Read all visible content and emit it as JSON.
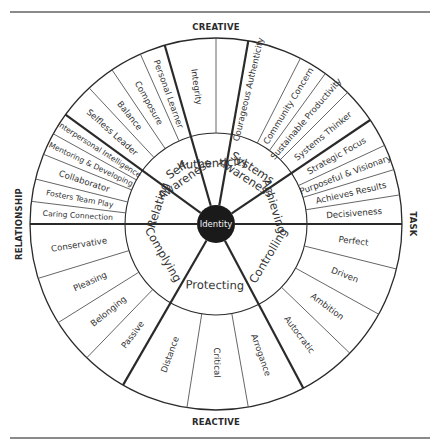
{
  "axes": {
    "top": "CREATIVE",
    "bottom": "REACTIVE",
    "left": "RELATIONSHIP",
    "right": "TASK"
  },
  "center": {
    "label": "Identity",
    "fill": "#1a1a1a"
  },
  "geometry": {
    "cx": 216,
    "cy": 224,
    "r_center": 19,
    "r_inner": 91,
    "r_outer": 186
  },
  "colors": {
    "line": "#2a2a2a",
    "thin_line": "#555555",
    "background": "#ffffff"
  },
  "inner_sectors": [
    {
      "label": "Achieving",
      "start": 0,
      "end": 34
    },
    {
      "label": "Systems Awareness",
      "lines": [
        "Systems",
        "Awareness"
      ],
      "start": 34,
      "end": 80
    },
    {
      "label": "Authenticity",
      "start": 80,
      "end": 106
    },
    {
      "label": "Self-Awareness",
      "lines": [
        "Self-",
        "Awareness"
      ],
      "start": 106,
      "end": 144
    },
    {
      "label": "Relating",
      "start": 144,
      "end": 180
    },
    {
      "label": "Complying",
      "start": 180,
      "end": 240
    },
    {
      "label": "Protecting",
      "start": 240,
      "end": 298
    },
    {
      "label": "Controlling",
      "start": 298,
      "end": 360
    }
  ],
  "outer_segments": [
    {
      "label": "Decisiveness",
      "start": 0,
      "end": 9
    },
    {
      "label": "Achieves Results",
      "start": 9,
      "end": 17
    },
    {
      "label": "Purposeful & Visionary",
      "start": 17,
      "end": 25
    },
    {
      "label": "Strategic Focus",
      "start": 25,
      "end": 34
    },
    {
      "label": "Systems Thinker",
      "start": 34,
      "end": 45
    },
    {
      "label": "Sustainable Productivity",
      "start": 45,
      "end": 54
    },
    {
      "label": "Community Concern",
      "start": 54,
      "end": 63
    },
    {
      "label": "Courageous Authenticity",
      "start": 63,
      "end": 90
    },
    {
      "label": "Integrity",
      "start": 90,
      "end": 106
    },
    {
      "label": "Personal Learner",
      "start": 106,
      "end": 114
    },
    {
      "label": "Composure",
      "start": 114,
      "end": 124
    },
    {
      "label": "Balance",
      "start": 124,
      "end": 133
    },
    {
      "label": "Selfless Leader",
      "start": 133,
      "end": 144
    },
    {
      "label": "Interpersonal Intelligence",
      "start": 144,
      "end": 151
    },
    {
      "label": "Mentoring & Developing",
      "start": 151,
      "end": 158
    },
    {
      "label": "Collaborator",
      "start": 158,
      "end": 166
    },
    {
      "label": "Fosters Team Play",
      "start": 166,
      "end": 173
    },
    {
      "label": "Caring Connection",
      "start": 173,
      "end": 180
    },
    {
      "label": "Conservative",
      "start": 180,
      "end": 197
    },
    {
      "label": "Pleasing",
      "start": 197,
      "end": 212
    },
    {
      "label": "Belonging",
      "start": 212,
      "end": 226
    },
    {
      "label": "Passive",
      "start": 226,
      "end": 240
    },
    {
      "label": "Distance",
      "start": 240,
      "end": 261
    },
    {
      "label": "Critical",
      "start": 261,
      "end": 280
    },
    {
      "label": "Arrogance",
      "start": 280,
      "end": 298
    },
    {
      "label": "Autocratic",
      "start": 298,
      "end": 316
    },
    {
      "label": "Ambition",
      "start": 316,
      "end": 331
    },
    {
      "label": "Driven",
      "start": 331,
      "end": 346
    },
    {
      "label": "Perfect",
      "start": 346,
      "end": 360
    }
  ]
}
